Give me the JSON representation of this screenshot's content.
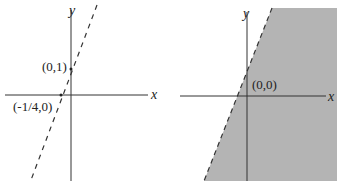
{
  "left_graph": {
    "x_axis_label": "x",
    "y_axis_label": "y",
    "point_y_intercept": "(0,1)",
    "point_x_intercept": "(-1/4,0)",
    "line_style": "dashed",
    "shaded": false
  },
  "right_graph": {
    "x_axis_label": "x",
    "y_axis_label": "y",
    "test_point": "(0,0)",
    "line_style": "dashed",
    "shaded": true,
    "shade_color": "#b4b4b4"
  }
}
